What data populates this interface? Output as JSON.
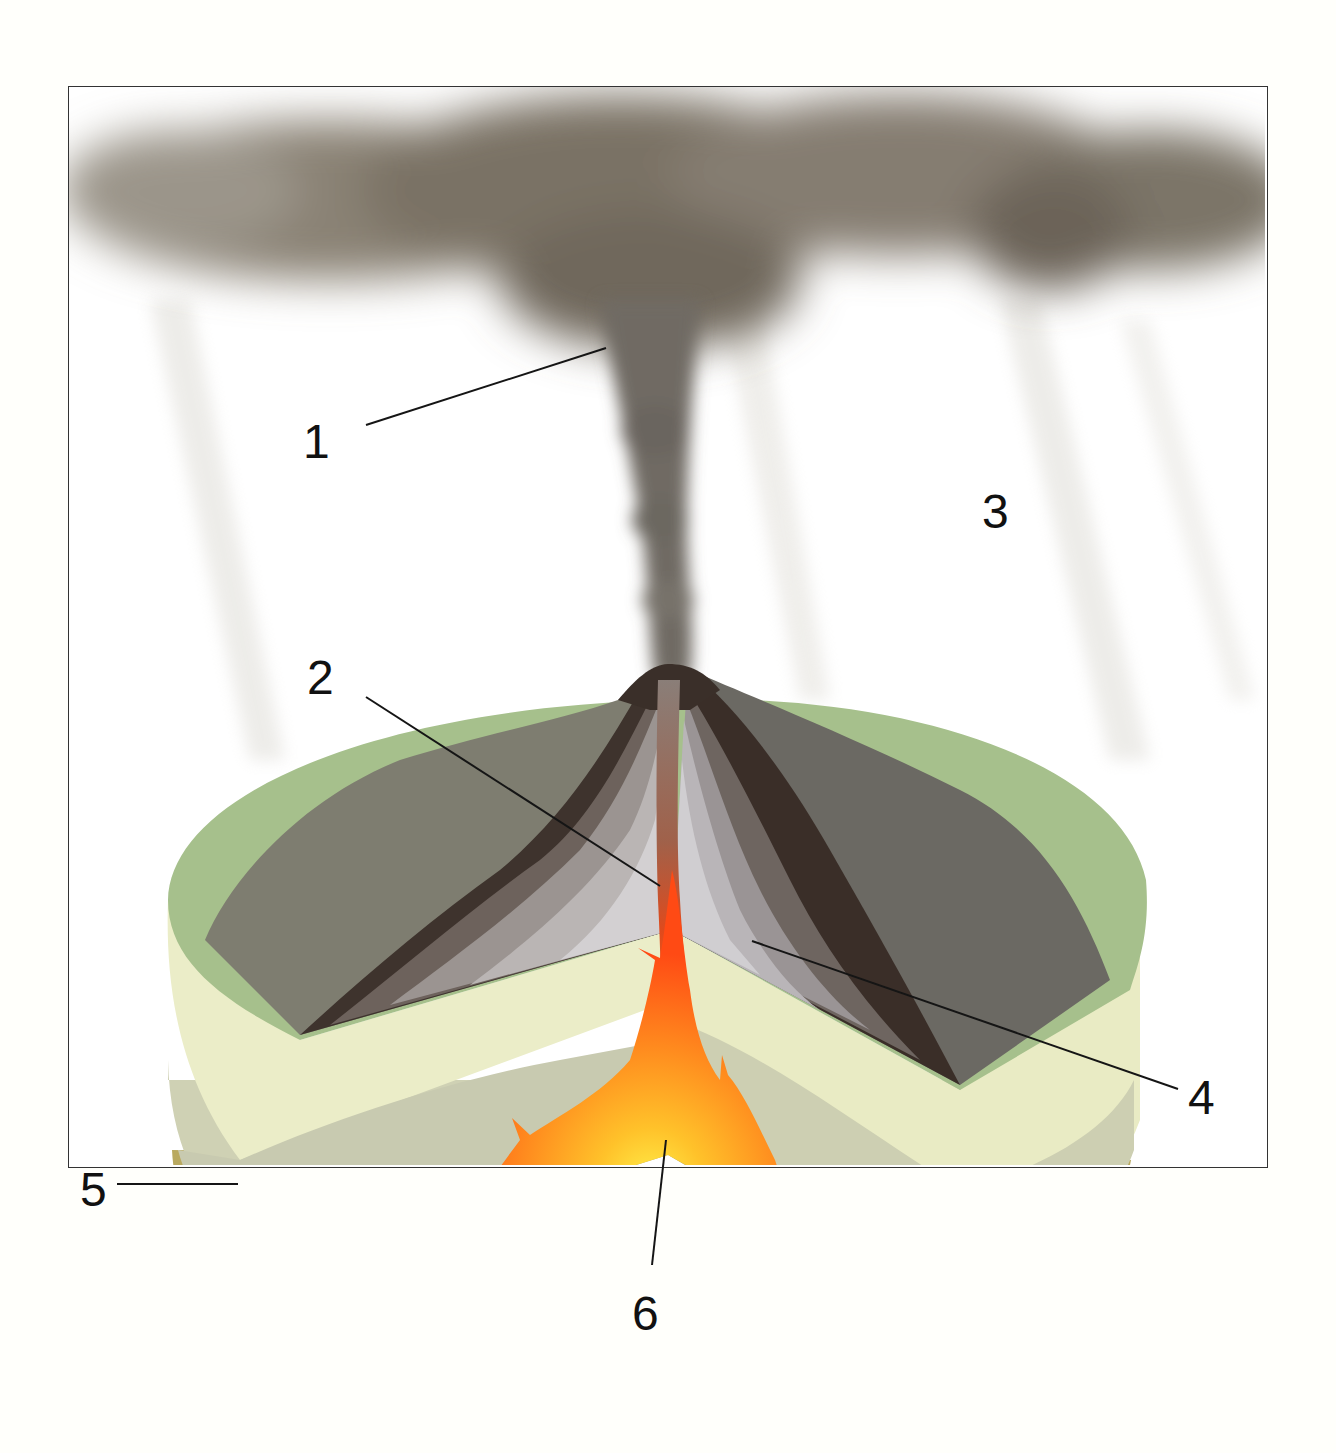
{
  "diagram": {
    "labels": [
      {
        "id": "1",
        "text": "1",
        "x": 303,
        "y": 418
      },
      {
        "id": "2",
        "text": "2",
        "x": 307,
        "y": 654
      },
      {
        "id": "3",
        "text": "3",
        "x": 982,
        "y": 488
      },
      {
        "id": "4",
        "text": "4",
        "x": 1188,
        "y": 1074
      },
      {
        "id": "5",
        "text": "5",
        "x": 80,
        "y": 1166
      },
      {
        "id": "6",
        "text": "6",
        "x": 632,
        "y": 1290
      }
    ],
    "leader_lines": [
      {
        "label": "1",
        "from": [
          366,
          425
        ],
        "to": [
          606,
          348
        ]
      },
      {
        "label": "2",
        "from": [
          366,
          697
        ],
        "to": [
          660,
          886
        ]
      },
      {
        "label": "4",
        "from": [
          1178,
          1089
        ],
        "to": [
          752,
          941
        ]
      },
      {
        "label": "5",
        "from": [
          117,
          1184
        ],
        "to": [
          238,
          1184
        ]
      },
      {
        "label": "6",
        "from": [
          652,
          1265
        ],
        "to": [
          666,
          1140
        ]
      }
    ],
    "colors": {
      "ash_cloud": "#6e665a",
      "grass": "#9cba84",
      "cone_dark": "#3b2f28",
      "cone_light": "#c9c5c8",
      "strata_light": "#ecedc6",
      "strata_mid": "#cfcfb1",
      "bedrock": "#b9a95f",
      "magma_hot": "#ffd52a",
      "magma_edge": "#ff4a14",
      "frame_border": "#333333"
    }
  }
}
